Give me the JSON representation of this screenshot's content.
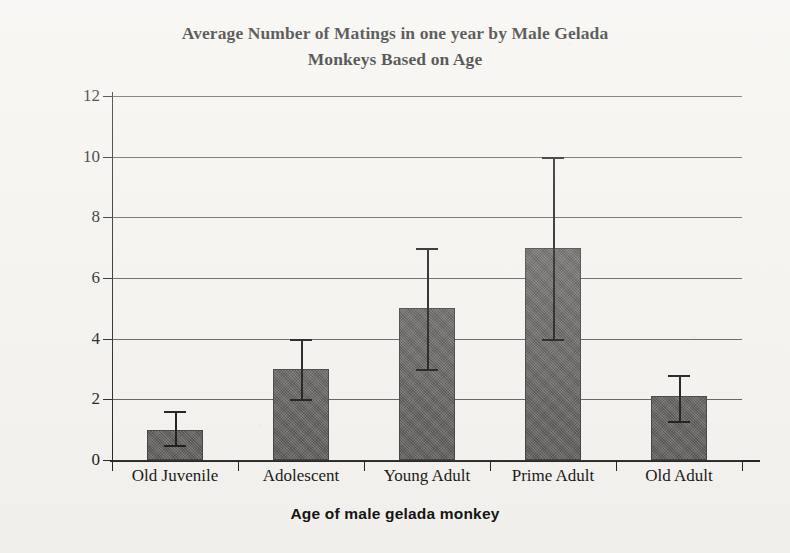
{
  "chart_data": {
    "type": "bar",
    "title": "Average Number of Matings in one year by Male Gelada Monkeys Based on Age",
    "title_lines": [
      "Average Number of Matings in one year by Male Gelada",
      "Monkeys Based on Age"
    ],
    "xlabel": "Age of male gelada monkey",
    "ylabel": "Number of matings",
    "categories": [
      "Old Juvenile",
      "Adolescent",
      "Young Adult",
      "Prime Adult",
      "Old Adult"
    ],
    "values": [
      1.0,
      3.0,
      5.0,
      7.0,
      2.1
    ],
    "error_low": [
      0.5,
      2.0,
      3.0,
      4.0,
      1.3
    ],
    "error_high": [
      1.6,
      4.0,
      7.0,
      10.0,
      2.8
    ],
    "ylim": [
      0,
      12
    ],
    "yticks": [
      0,
      2,
      4,
      6,
      8,
      10,
      12
    ],
    "ytick_labels": [
      "0",
      "2",
      "4",
      "6",
      "8",
      "10",
      "12"
    ],
    "grid": true,
    "legend": false,
    "bar_color": "#585755",
    "error_color": "#111111",
    "background_color": "#f4f3ef",
    "axis_color": "#1b1a18"
  }
}
